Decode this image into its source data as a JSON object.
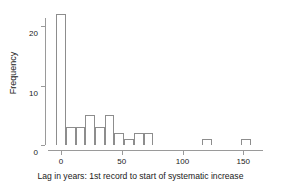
{
  "figure": {
    "width": 281,
    "height": 190,
    "background": "#ffffff",
    "line_color": "#8d8d8d",
    "text_color": "#1a1a1a"
  },
  "chart_data": {
    "type": "bar",
    "title": "",
    "subtitle": "",
    "xlabel": "Lag in years: 1st record to start of systematic increase",
    "ylabel": "Frequency",
    "grid": false,
    "legend": false,
    "legend_position": "none",
    "xlim": [
      -8,
      168
    ],
    "ylim": [
      0,
      23
    ],
    "x_ticks": [
      0,
      50,
      100,
      150
    ],
    "x_tick_labels": [
      "0",
      "50",
      "100",
      "150"
    ],
    "y_ticks": [
      0,
      10,
      20
    ],
    "y_tick_labels": [
      "0",
      "10",
      "20"
    ],
    "bin_width": 8,
    "bin_starts": [
      -4,
      4,
      12,
      20,
      28,
      36,
      44,
      52,
      60,
      68,
      76,
      84,
      92,
      100,
      108,
      116,
      124,
      132,
      140,
      148
    ],
    "bin_centers": [
      0,
      8,
      16,
      24,
      32,
      40,
      48,
      56,
      64,
      72,
      80,
      88,
      96,
      104,
      112,
      120,
      128,
      136,
      144,
      152
    ],
    "values": [
      22,
      3,
      3,
      5,
      3,
      5,
      2,
      1,
      2,
      2,
      0,
      0,
      0,
      0,
      0,
      1,
      0,
      0,
      0,
      1
    ],
    "categories": [
      "0",
      "8",
      "16",
      "24",
      "32",
      "40",
      "48",
      "56",
      "64",
      "72",
      "80",
      "88",
      "96",
      "104",
      "112",
      "120",
      "128",
      "136",
      "144",
      "152"
    ],
    "max_value": 22,
    "total_count": 50,
    "bar_fill": "transparent",
    "bar_edge": "#8d8d8d"
  }
}
